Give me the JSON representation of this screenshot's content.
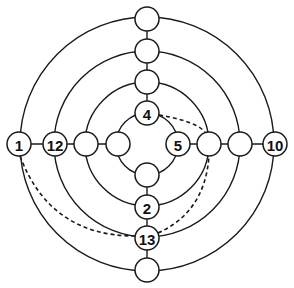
{
  "diagram": {
    "title": "",
    "center": {
      "x": 147,
      "y": 144
    },
    "rings": [
      {
        "id": "inner",
        "r": 31
      },
      {
        "id": "ring2",
        "r": 62
      },
      {
        "id": "ring3",
        "r": 93
      },
      {
        "id": "outer",
        "r": 127
      }
    ],
    "nodes": [
      {
        "id": "n-left-outer",
        "x": 19,
        "y": 144,
        "label": "1"
      },
      {
        "id": "n-left-ring3",
        "x": 55,
        "y": 144,
        "label": "12"
      },
      {
        "id": "n-left-ring2",
        "x": 86,
        "y": 144,
        "label": ""
      },
      {
        "id": "n-left-inner",
        "x": 118,
        "y": 144,
        "label": ""
      },
      {
        "id": "n-right-inner",
        "x": 178,
        "y": 144,
        "label": "5"
      },
      {
        "id": "n-right-ring2",
        "x": 209,
        "y": 144,
        "label": ""
      },
      {
        "id": "n-right-ring3",
        "x": 240,
        "y": 144,
        "label": ""
      },
      {
        "id": "n-right-outer",
        "x": 275,
        "y": 144,
        "label": "10"
      },
      {
        "id": "n-top-outer",
        "x": 147,
        "y": 19,
        "label": ""
      },
      {
        "id": "n-top-ring3",
        "x": 147,
        "y": 51,
        "label": ""
      },
      {
        "id": "n-top-ring2",
        "x": 147,
        "y": 82,
        "label": ""
      },
      {
        "id": "n-top-inner",
        "x": 147,
        "y": 113,
        "label": "4"
      },
      {
        "id": "n-bottom-inner",
        "x": 147,
        "y": 175,
        "label": ""
      },
      {
        "id": "n-bottom-ring2",
        "x": 147,
        "y": 207,
        "label": "2"
      },
      {
        "id": "n-bottom-ring3",
        "x": 147,
        "y": 238,
        "label": "13"
      },
      {
        "id": "n-bottom-outer",
        "x": 147,
        "y": 270,
        "label": ""
      }
    ],
    "node_radius": 12,
    "dashed_connections": [
      {
        "from": "4",
        "to": "n-right-ring2"
      },
      {
        "from": "1",
        "to": "13"
      },
      {
        "from": "13",
        "to": "n-right-ring2"
      }
    ],
    "labels": [
      "1",
      "12",
      "5",
      "10",
      "4",
      "2",
      "13"
    ]
  }
}
